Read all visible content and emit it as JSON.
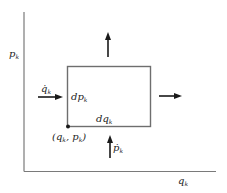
{
  "diagram": {
    "labels": {
      "y_axis": {
        "base": "p",
        "sub": "k"
      },
      "x_axis": {
        "base": "q",
        "sub": "k"
      },
      "q_dot": {
        "base": "q̇",
        "sub": "k"
      },
      "p_dot": {
        "base": "ṗ",
        "sub": "k"
      },
      "dp": {
        "base": "dp",
        "sub": "k"
      },
      "dq": {
        "base": "dq",
        "sub": "k"
      },
      "corner_point": {
        "open": "(q",
        "sub1": "k",
        "mid": ", p",
        "sub2": "k",
        "close": ")"
      }
    },
    "arrows": [
      {
        "name": "inflow-left",
        "direction": "right"
      },
      {
        "name": "outflow-right",
        "direction": "right"
      },
      {
        "name": "inflow-bottom",
        "direction": "up"
      },
      {
        "name": "outflow-top",
        "direction": "up"
      }
    ],
    "colors": {
      "axis": "#7a7a7a",
      "box": "#6e6e6e",
      "arrow": "#1a1a1a",
      "text": "#222222"
    }
  }
}
